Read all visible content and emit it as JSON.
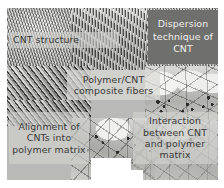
{
  "figure": {
    "name": "cnt-polymer-composite-collage",
    "background_color": "#b9b9b7",
    "panels": [
      {
        "id": "cnt-bundle",
        "texture": "tangled-cnt-bundle",
        "position": "top-left"
      },
      {
        "id": "cnt-fiber",
        "texture": "vertical-cnt-fiber-array",
        "position": "top-center"
      },
      {
        "id": "cnt-dispersion",
        "texture": "cnt-dispersion-micrograph",
        "position": "top-right"
      },
      {
        "id": "cnt-alignment",
        "texture": "diagonal-aligned-cnt-array",
        "position": "middle-left"
      },
      {
        "id": "cnt-cells-right",
        "texture": "cellular-foam-with-cnt-clusters",
        "position": "middle-right"
      },
      {
        "id": "cnt-cells-bottom",
        "texture": "cellular-foam-with-cnt-clusters",
        "position": "bottom-center"
      }
    ]
  },
  "labels": {
    "cnt_structure": "CNT structure",
    "dispersion": "Dispersion technique of CNT",
    "composite_fibers": "Polymer/CNT composite fibers",
    "alignment": "Alignment of CNTs into polymer matrix",
    "interaction": "Interaction between CNT and polymer matrix"
  },
  "colors": {
    "dark_box": "#6f6f6d",
    "dark_box_text": "#efefed",
    "label_text": "#3a3a38",
    "label_panel": "#d6d6d3",
    "page_background": "#ffffff"
  }
}
